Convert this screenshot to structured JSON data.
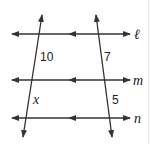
{
  "diagram": {
    "type": "parallel-lines-transversals",
    "parallel_lines": [
      {
        "name": "ℓ",
        "y": 34
      },
      {
        "name": "m",
        "y": 80
      },
      {
        "name": "n",
        "y": 118
      }
    ],
    "segment_labels": {
      "left_upper": "10",
      "left_lower": "x",
      "right_upper": "7",
      "right_lower": "5"
    },
    "colors": {
      "line": "#333333",
      "text": "#222222",
      "border": "#e6e6e6"
    }
  }
}
